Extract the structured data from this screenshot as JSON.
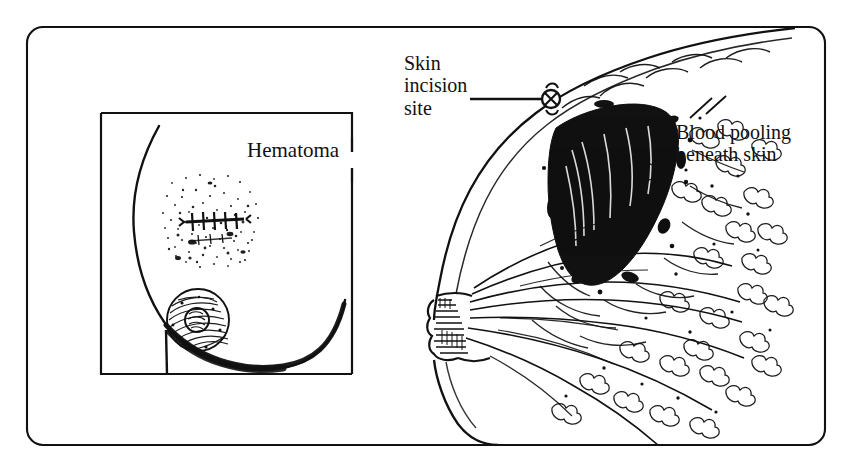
{
  "figure": {
    "kind": "medical-illustration",
    "style": "pen-and-ink line drawing",
    "ink_color": "#111111",
    "background_color": "#ffffff",
    "frame": {
      "shape": "rounded-rectangle",
      "corner_radius": 16
    }
  },
  "labels": {
    "hematoma": "Hematoma",
    "skin_incision_site": "Skin\nincision\nsite",
    "blood_pooling": "Blood pooling\nbeneath skin"
  },
  "inset": {
    "name": "frontal-view-inset",
    "border": "open-on-upper-right",
    "contents": [
      "breast outline",
      "stippled hematoma bruise",
      "sutured incision line",
      "areola and nipple"
    ]
  },
  "main_view": {
    "name": "sagittal-cross-section",
    "contents": [
      "skin surface",
      "solid black hematoma mass",
      "suture knot marker at incision site",
      "nipple in profile",
      "lactiferous ducts",
      "glandular lobules",
      "chest wall baseline"
    ]
  },
  "leader_lines": [
    {
      "from": "skin-incision-site-label",
      "to": "suture-knot-marker"
    },
    {
      "from": "hematoma-label",
      "to": "inset-frame-gap"
    }
  ]
}
